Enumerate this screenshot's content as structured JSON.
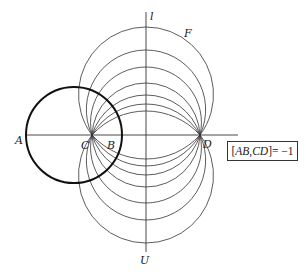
{
  "diagram": {
    "points": {
      "A": {
        "label": "A"
      },
      "B": {
        "label": "B"
      },
      "C": {
        "label": "C"
      },
      "D": {
        "label": "D"
      }
    },
    "lines": {
      "axis_vertical_top_label": "l",
      "axis_vertical_bottom_label": "U"
    },
    "family_label": "F",
    "family_arc_count_per_side": 7,
    "relation": {
      "text_lhs_open": "[",
      "text_pair1": "AB",
      "text_sep": ", ",
      "text_pair2": "CD",
      "text_close": "]",
      "text_rhs": " = −1"
    },
    "caption": "",
    "colors": {
      "stroke": "#333333",
      "thick_circle": "#111111",
      "background": "#ffffff"
    }
  }
}
